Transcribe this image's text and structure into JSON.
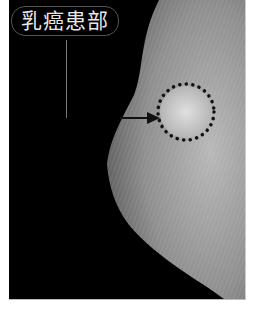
{
  "figure": {
    "label": "乳癌患部",
    "annotation": {
      "type": "dotted-circle",
      "center": [
        186,
        112
      ],
      "radius": 28
    },
    "arrow": {
      "from": [
        120,
        118
      ],
      "to": [
        160,
        118
      ]
    },
    "colors": {
      "background": "#000000",
      "tissue": "#9a9a9a",
      "marker": "#111111"
    }
  }
}
